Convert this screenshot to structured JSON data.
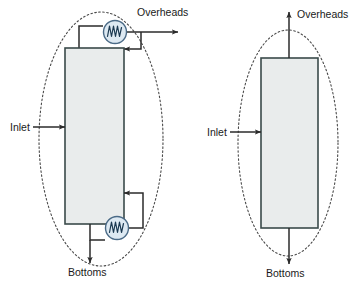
{
  "figure": {
    "title": "",
    "type": "process-flow-diagram",
    "colors": {
      "column_fill": "#e9ecec",
      "column_stroke": "#3a4a4a",
      "line": "#2b2b2b",
      "boundary": "#4a4a4a",
      "exchanger_fill": "#dde9f2",
      "exchanger_stroke": "#4a6a86",
      "text": "#1a1a1a",
      "background": "#ffffff"
    }
  },
  "diagrams": [
    {
      "id": "left",
      "name": "column-with-condenser-and-reboiler",
      "boundary": {
        "shape": "dashed-ellipse",
        "cx": 101,
        "cy": 139,
        "rx": 62,
        "ry": 127
      },
      "column": {
        "name": "distillation-column",
        "x": 65,
        "y": 48,
        "width": 59,
        "height": 176
      },
      "streams": [
        {
          "name": "inlet",
          "label": "Inlet",
          "label_x": 10,
          "label_y": 131,
          "direction": "right"
        },
        {
          "name": "overheads",
          "label": "Overheads",
          "label_x": 137,
          "label_y": 16,
          "direction": "right"
        },
        {
          "name": "bottoms",
          "label": "Bottoms",
          "label_x": 68,
          "label_y": 276,
          "direction": "down"
        }
      ],
      "equipment": [
        {
          "name": "condenser",
          "icon": "heat-exchanger-icon",
          "cx": 115,
          "cy": 32,
          "r": 12
        },
        {
          "name": "reboiler",
          "icon": "heat-exchanger-icon",
          "cx": 117,
          "cy": 228,
          "r": 12
        }
      ]
    },
    {
      "id": "right",
      "name": "column-black-box",
      "boundary": {
        "shape": "dashed-ellipse",
        "cx": 288,
        "cy": 143,
        "rx": 50,
        "ry": 113
      },
      "column": {
        "name": "distillation-column",
        "x": 261,
        "y": 58,
        "width": 57,
        "height": 170
      },
      "streams": [
        {
          "name": "inlet",
          "label": "Inlet",
          "label_x": 207,
          "label_y": 136,
          "direction": "right"
        },
        {
          "name": "overheads",
          "label": "Overheads",
          "label_x": 297,
          "label_y": 18,
          "direction": "up"
        },
        {
          "name": "bottoms",
          "label": "Bottoms",
          "label_x": 266,
          "label_y": 277,
          "direction": "down"
        }
      ],
      "equipment": []
    }
  ],
  "labels": {
    "inlet_left": "Inlet",
    "overheads_left": "Overheads",
    "bottoms_left": "Bottoms",
    "inlet_right": "Inlet",
    "overheads_right": "Overheads",
    "bottoms_right": "Bottoms"
  }
}
